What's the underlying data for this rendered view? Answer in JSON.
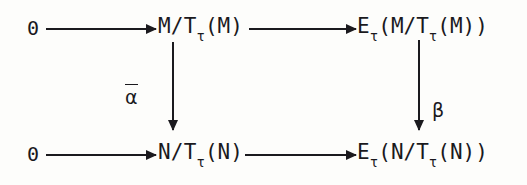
{
  "figure": {
    "kind": "commutative-diagram",
    "background_color": "#fdfdfb",
    "ink_color": "#1a191d"
  },
  "objects": {
    "top_left_zero": "0",
    "top_mid": {
      "base": "M/T",
      "sub": "τ",
      "arg": "(M)"
    },
    "top_right": {
      "base": "E",
      "sub": "τ",
      "open": "(M/T",
      "sub2": "τ",
      "close": "(M))"
    },
    "bottom_left_zero": "0",
    "bottom_mid": {
      "base": "N/T",
      "sub": "τ",
      "arg": "(N)"
    },
    "bottom_right": {
      "base": "E",
      "sub": "τ",
      "open": "(N/T",
      "sub2": "τ",
      "close": "(N))"
    }
  },
  "arrows": {
    "top_left_horizontal": {
      "label": "",
      "direction": "right"
    },
    "top_right_horizontal": {
      "label": "",
      "direction": "right"
    },
    "bottom_left_horizontal": {
      "label": "",
      "direction": "right"
    },
    "bottom_right_horizontal": {
      "label": "",
      "direction": "right"
    },
    "left_vertical": {
      "label": "α",
      "label_style": "overline",
      "direction": "down"
    },
    "right_vertical": {
      "label": "β",
      "label_style": "plain",
      "direction": "down"
    }
  }
}
